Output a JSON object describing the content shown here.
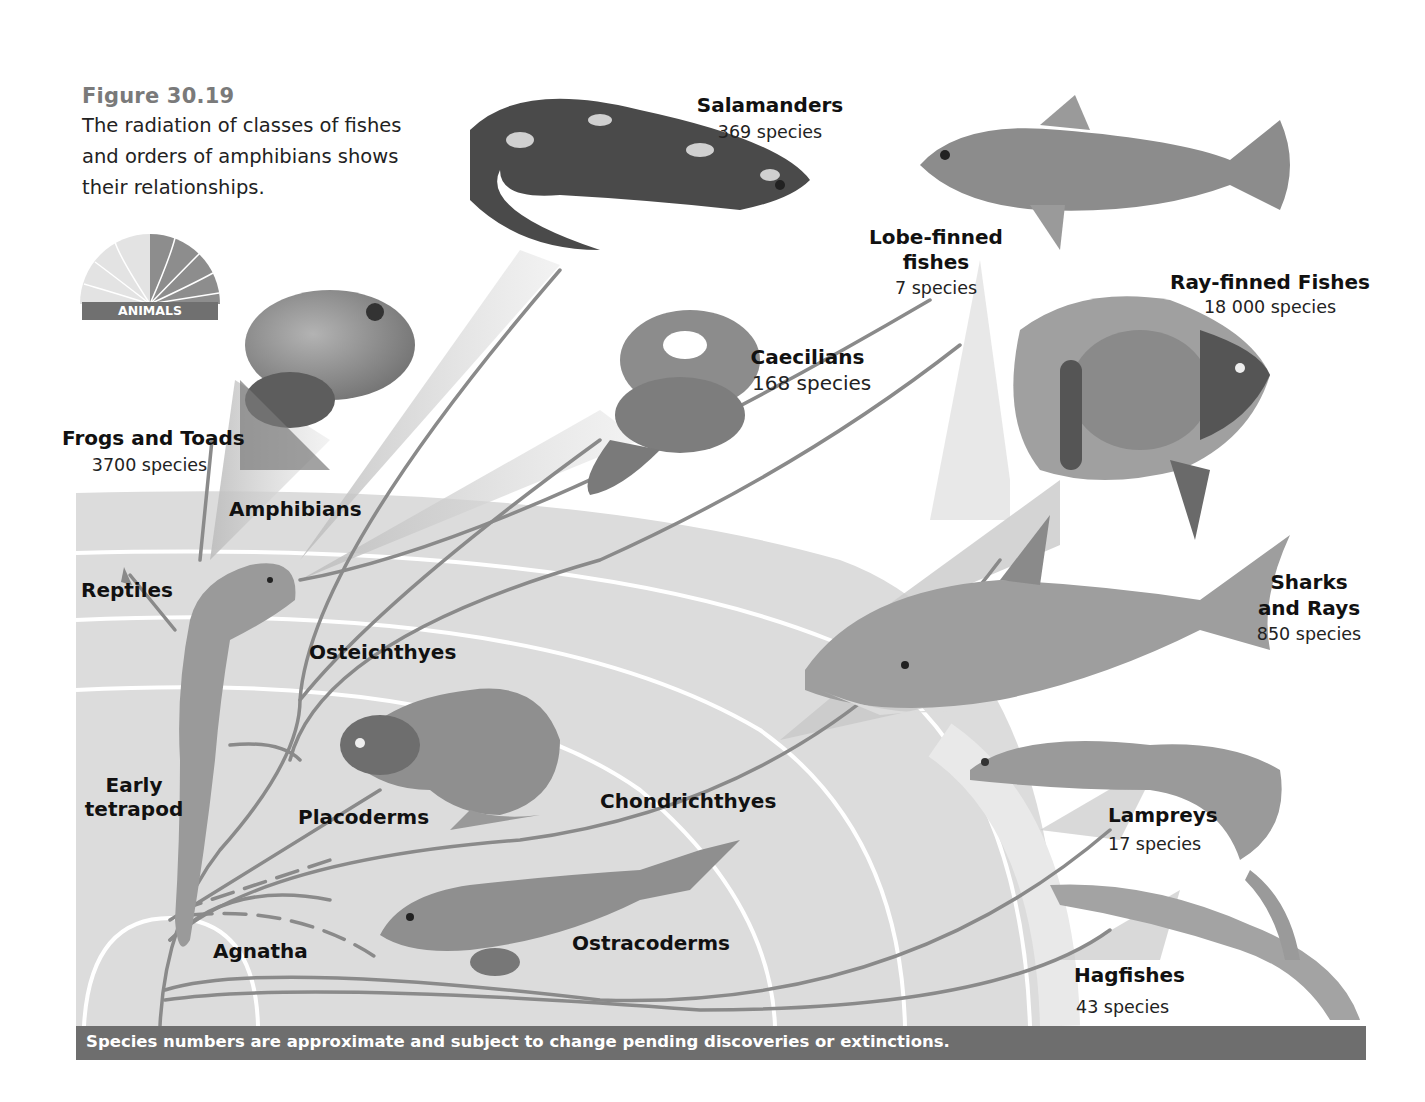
{
  "figure": {
    "number": "Figure 30.19",
    "caption": "The radiation of classes of fishes and orders of amphibians shows their relationships.",
    "logo_label": "ANIMALS"
  },
  "groups": [
    {
      "id": "frogs",
      "name": "Frogs and Toads",
      "count": "3700 species"
    },
    {
      "id": "salamanders",
      "name": "Salamanders",
      "count": "369 species"
    },
    {
      "id": "caecilians",
      "name": "Caecilians",
      "count": "168 species"
    },
    {
      "id": "lobe",
      "name_line1": "Lobe-finned",
      "name_line2": "fishes",
      "count": "7 species"
    },
    {
      "id": "ray",
      "name": "Ray-finned Fishes",
      "count": "18 000 species"
    },
    {
      "id": "sharks",
      "name_line1": "Sharks",
      "name_line2": "and Rays",
      "count": "850 species"
    },
    {
      "id": "lampreys",
      "name": "Lampreys",
      "count": "17 species"
    },
    {
      "id": "hagfishes",
      "name": "Hagfishes",
      "count": "43 species"
    }
  ],
  "clades": {
    "amphibians": "Amphibians",
    "reptiles": "Reptiles",
    "osteichthyes": "Osteichthyes",
    "early_tetrapod_line1": "Early",
    "early_tetrapod_line2": "tetrapod",
    "placoderms": "Placoderms",
    "chondrichthyes": "Chondrichthyes",
    "agnatha": "Agnatha",
    "ostracoderms": "Ostracoderms"
  },
  "footer": {
    "note": "Species numbers are approximate and subject to change pending discoveries or extinctions."
  },
  "colors": {
    "title_gray": "#7a7a7a",
    "band_gray": "#d9d9d9",
    "branch_gray": "#8a8a8a",
    "footer_bar": "#6e6e6e"
  }
}
